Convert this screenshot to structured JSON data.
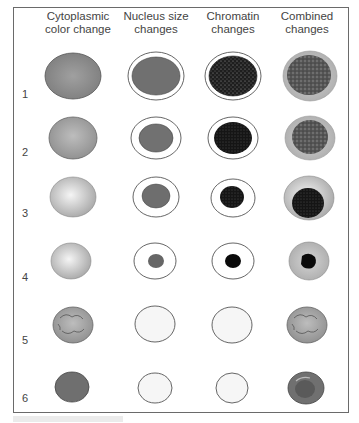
{
  "figure": {
    "columns": [
      {
        "label": "Cytoplasmic color change",
        "line1": "Cytoplasmic",
        "line2": "color change"
      },
      {
        "label": "Nucleus size changes",
        "line1": "Nucleus size",
        "line2": "changes"
      },
      {
        "label": "Chromatin changes",
        "line1": "Chromatin",
        "line2": "changes"
      },
      {
        "label": "Combined changes",
        "line1": "Combined",
        "line2": "changes"
      }
    ],
    "rows": [
      {
        "label": "1"
      },
      {
        "label": "2"
      },
      {
        "label": "3"
      },
      {
        "label": "4"
      },
      {
        "label": "5"
      },
      {
        "label": "6"
      }
    ],
    "colors": {
      "cytoplasm_dark": "#8a8a8a",
      "cytoplasm_light": "#cfcfcf",
      "nucleus": "#6e6e6e",
      "chromatin": "#1a1a1a",
      "outline": "#555555",
      "frame": "#6a6a6a"
    }
  }
}
